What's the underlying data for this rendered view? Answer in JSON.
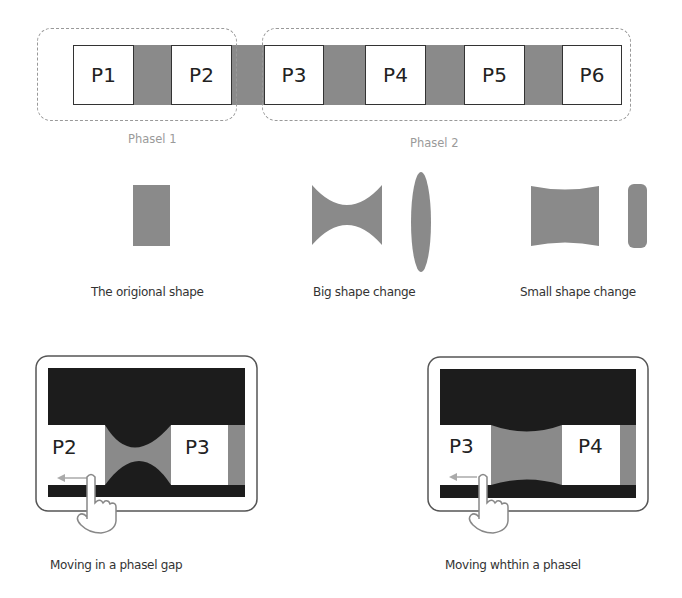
{
  "strip": {
    "panels": [
      {
        "id": "P1",
        "label": "P1"
      },
      {
        "id": "P2",
        "label": "P2"
      },
      {
        "id": "P3",
        "label": "P3"
      },
      {
        "id": "P4",
        "label": "P4"
      },
      {
        "id": "P5",
        "label": "P5"
      },
      {
        "id": "P6",
        "label": "P6"
      }
    ],
    "groups": [
      {
        "label": "Phasel 1",
        "members": [
          "P1",
          "P2"
        ]
      },
      {
        "label": "Phasel 2",
        "members": [
          "P3",
          "P4",
          "P5",
          "P6"
        ]
      }
    ]
  },
  "shapes": [
    {
      "caption": "The origional shape"
    },
    {
      "caption": "Big shape change"
    },
    {
      "caption": "Small shape change"
    }
  ],
  "tablets": [
    {
      "left_panel": "P2",
      "right_panel": "P3",
      "caption": "Moving in a phasel gap"
    },
    {
      "left_panel": "P3",
      "right_panel": "P4",
      "caption": "Moving whthin a phasel"
    }
  ],
  "colors": {
    "gap_gray": "#8a8a8a",
    "dark": "#1c1c1c",
    "panel_border": "#333333",
    "dashed_border": "#999999",
    "group_label": "#9a9a9a"
  }
}
